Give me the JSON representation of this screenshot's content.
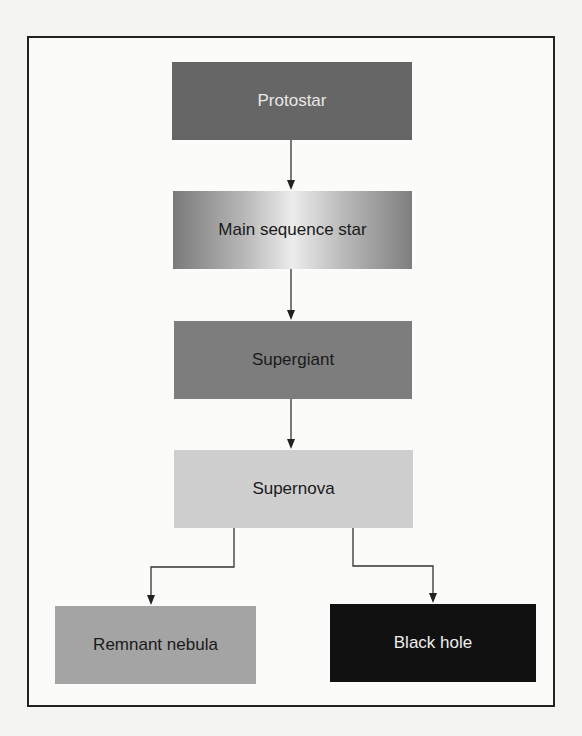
{
  "diagram": {
    "type": "flowchart",
    "title": "",
    "nodes": [
      {
        "id": "protostar",
        "label": "Protostar",
        "fill": "#666666",
        "text_color": "#e8e8e8"
      },
      {
        "id": "main_sequence",
        "label": "Main sequence star",
        "fill": "gradient-gray",
        "text_color": "#1a1a1a"
      },
      {
        "id": "supergiant",
        "label": "Supergiant",
        "fill": "#7d7d7d",
        "text_color": "#1a1a1a"
      },
      {
        "id": "supernova",
        "label": "Supernova",
        "fill": "#cfcfcf",
        "text_color": "#1a1a1a"
      },
      {
        "id": "remnant_nebula",
        "label": "Remnant nebula",
        "fill": "#a4a4a4",
        "text_color": "#1a1a1a"
      },
      {
        "id": "black_hole",
        "label": "Black hole",
        "fill": "#111111",
        "text_color": "#eeeeee"
      }
    ],
    "edges": [
      {
        "from": "protostar",
        "to": "main_sequence"
      },
      {
        "from": "main_sequence",
        "to": "supergiant"
      },
      {
        "from": "supergiant",
        "to": "supernova"
      },
      {
        "from": "supernova",
        "to": "remnant_nebula"
      },
      {
        "from": "supernova",
        "to": "black_hole"
      }
    ]
  }
}
